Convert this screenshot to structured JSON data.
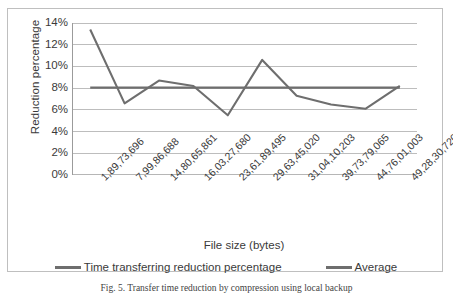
{
  "chart_data": {
    "type": "line",
    "title": "",
    "xlabel": "File size (bytes)",
    "ylabel": "Reduction percentage",
    "categories": [
      "1,89,73,696",
      "7,99,86,688",
      "14,80,65,861",
      "16,03,27,680",
      "23,61,89,495",
      "29,63,45,020",
      "31,04,10,203",
      "39,73,79,065",
      "44,76,01,003",
      "49,28,30,720"
    ],
    "series": [
      {
        "name": "Time transferring reduction percentage",
        "color": "#6e6e6e",
        "values": [
          13.4,
          6.6,
          8.7,
          8.2,
          5.5,
          10.6,
          7.3,
          6.5,
          6.1,
          8.2
        ]
      },
      {
        "name": "Average",
        "color": "#6e6e6e",
        "values": [
          8.05,
          8.05,
          8.05,
          8.05,
          8.05,
          8.05,
          8.05,
          8.05,
          8.05,
          8.05
        ]
      }
    ],
    "ylim": [
      0,
      14
    ],
    "ytick_labels": [
      "0%",
      "2%",
      "4%",
      "6%",
      "8%",
      "10%",
      "12%",
      "14%"
    ],
    "ytick_values": [
      0,
      2,
      4,
      6,
      8,
      10,
      12,
      14
    ],
    "grid": true,
    "grid_axis": "y",
    "legend_position": "bottom",
    "gridline_color": "#b6b6b6",
    "axis_color": "#9b9b9b",
    "border_color": "#bfbfbf",
    "background": "#ffffff"
  },
  "axis": {
    "y_title": "Reduction percentage",
    "x_title": "File size (bytes)"
  },
  "legend": {
    "entries": [
      {
        "label": "Time transferring reduction percentage"
      },
      {
        "label": "Average"
      }
    ]
  },
  "caption": {
    "text": "Fig. 5.  Transfer time reduction by compression using local backup"
  }
}
